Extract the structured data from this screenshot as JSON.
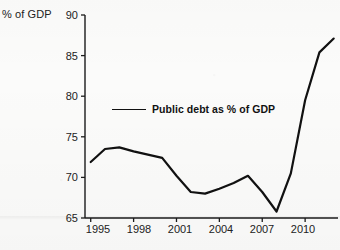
{
  "chart_data": {
    "type": "line",
    "title": "",
    "subtitle": "",
    "xlabel": "",
    "ylabel": "% of GDP",
    "yunit_label": "% of GDP",
    "legend": [
      "Public debt as % of GDP"
    ],
    "legend_position": "inside-left",
    "grid": false,
    "xlim": [
      1994.6,
      2012.3
    ],
    "ylim": [
      65,
      90
    ],
    "yticks": [
      65,
      70,
      75,
      80,
      85,
      90
    ],
    "ytick_labels": [
      "65",
      "70",
      "75",
      "80",
      "85",
      "90"
    ],
    "xticks": [
      1995,
      1998,
      2001,
      2004,
      2007,
      2010
    ],
    "xtick_labels": [
      "1995",
      "1998",
      "2001",
      "2004",
      "2007",
      "2010"
    ],
    "x": [
      1995,
      1996,
      1997,
      1998,
      1999,
      2000,
      2001,
      2002,
      2003,
      2004,
      2005,
      2006,
      2007,
      2008,
      2009,
      2010,
      2011,
      2012
    ],
    "series": [
      {
        "name": "Public debt as % of GDP",
        "color": "#111111",
        "values": [
          71.9,
          73.5,
          73.7,
          73.2,
          72.8,
          72.4,
          70.2,
          68.2,
          68.0,
          68.6,
          69.3,
          70.2,
          68.2,
          65.8,
          70.5,
          79.5,
          85.4,
          87.1
        ]
      }
    ]
  },
  "axis": {
    "unit_label": "% of GDP"
  }
}
